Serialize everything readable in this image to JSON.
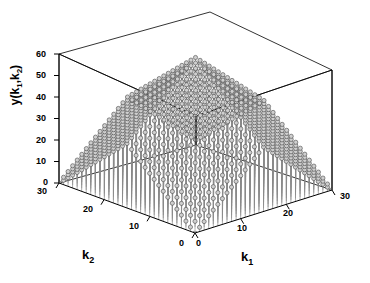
{
  "figure": {
    "type": "matlab-3d-stem-plot",
    "width": 370,
    "height": 283,
    "background": "#ffffff",
    "axis_color": "#000000",
    "stem_color": "#8a8a8a",
    "marker_color": "#cfcfcf",
    "marker_edge": "#4a4a4a",
    "dense_fill": "#3c3c3c"
  },
  "chart_data": {
    "type": "scatter",
    "plot_kind": "stem3",
    "title": "",
    "xlabel": "k_1",
    "ylabel": "k_2",
    "zlabel": "y(k_1,k_2)",
    "xlabel_display": "k",
    "xlabel_sub": "1",
    "ylabel_display": "k",
    "ylabel_sub": "2",
    "zlabel_display": "y(k",
    "zlabel_sub1": "1",
    "zlabel_mid": ",k",
    "zlabel_sub2": "2",
    "zlabel_end": ")",
    "xlim": [
      0,
      30
    ],
    "ylim": [
      0,
      30
    ],
    "zlim": [
      0,
      60
    ],
    "xticks": [
      0,
      10,
      20,
      30
    ],
    "yticks": [
      0,
      10,
      20,
      30
    ],
    "zticks": [
      0,
      10,
      20,
      30,
      40,
      50,
      60
    ],
    "xticklabels": [
      "0",
      "10",
      "20",
      "30"
    ],
    "yticklabels": [
      "0",
      "10",
      "20",
      "30"
    ],
    "zticklabels": [
      "0",
      "10",
      "20",
      "30",
      "40",
      "50",
      "60"
    ],
    "grid": false,
    "box": true,
    "legend": null,
    "view_azimuth": -37.5,
    "view_elevation": 30,
    "peak_value": 60,
    "grid_n": 31,
    "function": "y(k1,k2) = min(k1, 30-k1)*2 + min(k2, 30-k2)*2 (pyramid)"
  },
  "zticks": [
    {
      "label": "60",
      "x": 36,
      "y": 50
    },
    {
      "label": "50",
      "x": 36,
      "y": 72
    },
    {
      "label": "40",
      "x": 36,
      "y": 94
    },
    {
      "label": "30",
      "x": 36,
      "y": 116
    },
    {
      "label": "20",
      "x": 36,
      "y": 138
    },
    {
      "label": "10",
      "x": 36,
      "y": 160
    },
    {
      "label": "0",
      "x": 42,
      "y": 180
    }
  ],
  "yticks": [
    {
      "label": "30",
      "x": 38,
      "y": 189
    },
    {
      "label": "20",
      "x": 88,
      "y": 209
    },
    {
      "label": "10",
      "x": 140,
      "y": 227
    },
    {
      "label": "0",
      "x": 184,
      "y": 240
    }
  ],
  "xticks": [
    {
      "label": "0",
      "x": 199,
      "y": 240
    },
    {
      "label": "10",
      "x": 240,
      "y": 227
    },
    {
      "label": "20",
      "x": 294,
      "y": 209
    },
    {
      "label": "30",
      "x": 345,
      "y": 191
    }
  ],
  "axis_titles": {
    "k1": {
      "x": 244,
      "y": 254
    },
    "k2": {
      "x": 84,
      "y": 252
    }
  }
}
